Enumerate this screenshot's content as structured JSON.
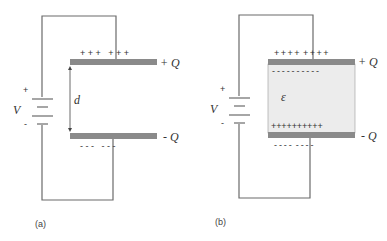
{
  "figure": {
    "panels": [
      {
        "id": "a",
        "caption": "(a)",
        "battery": {
          "label": "V",
          "plus": "+",
          "minus": "-"
        },
        "top_plate": {
          "charge_label": "+ Q",
          "charges": "+ + +   + + +"
        },
        "bottom_plate": {
          "charge_label": "- Q",
          "charges": "- - -   - - -"
        },
        "gap_label": "d"
      },
      {
        "id": "b",
        "caption": "(b)",
        "battery": {
          "label": "V",
          "plus": "+",
          "minus": "-"
        },
        "top_plate": {
          "charge_label": "+ Q",
          "charges": "+ + + +  + + + +",
          "induced": "- - - - - - - - - -"
        },
        "bottom_plate": {
          "charge_label": "- Q",
          "charges": "- - - -  - - - -",
          "induced": "+ + + + + + + + + +"
        },
        "dielectric_label": "ε"
      }
    ]
  },
  "colors": {
    "wire": "#6b6b6b",
    "plate": "#8a8a8a",
    "dielectric": "#ececec",
    "text": "#333333"
  }
}
